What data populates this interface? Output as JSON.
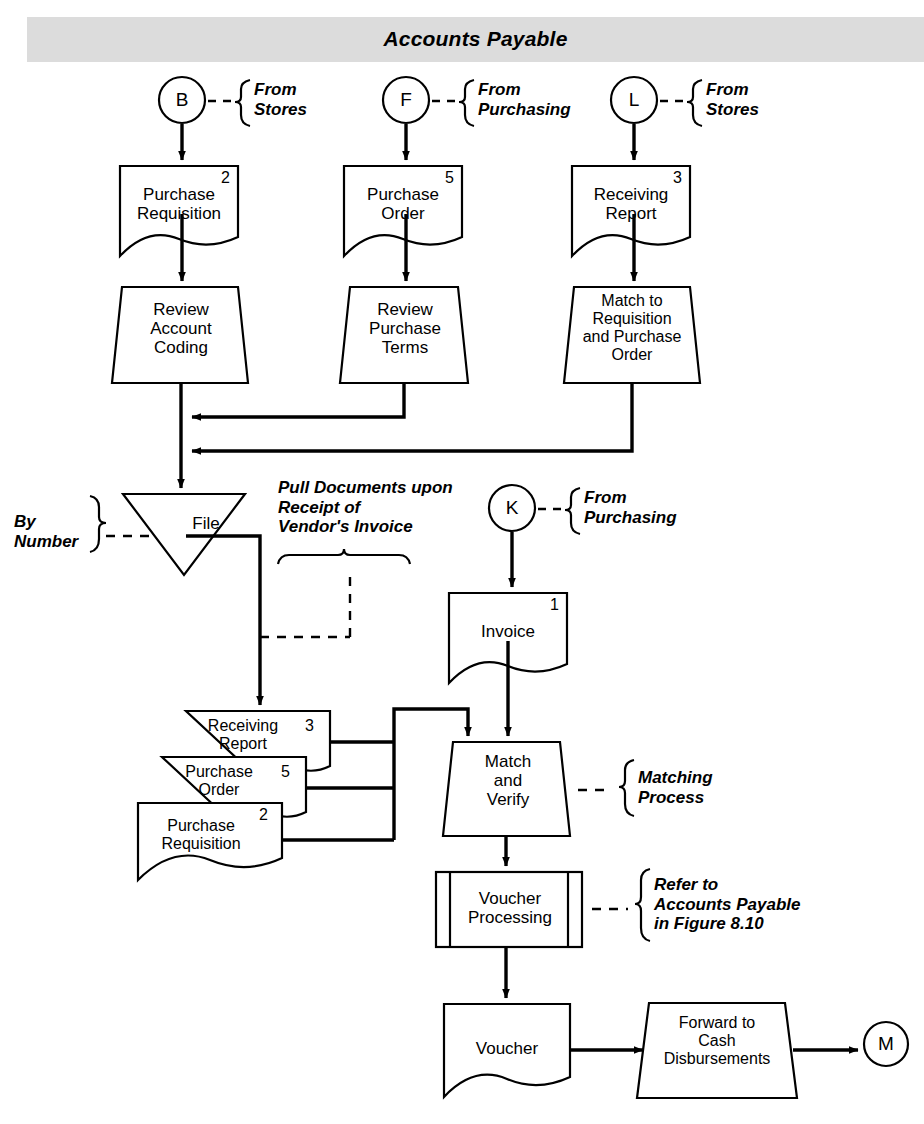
{
  "figure": {
    "band_title": "Accounts Payable",
    "band_color": "#dcdcdc",
    "line_color": "#000000",
    "background": "#ffffff"
  },
  "connectors": {
    "b": {
      "letter": "B",
      "note": "From\nStores"
    },
    "f": {
      "letter": "F",
      "note": "From\nPurchasing"
    },
    "l": {
      "letter": "L",
      "note": "From\nStores"
    },
    "k": {
      "letter": "K",
      "note": "From\nPurchasing"
    },
    "m": {
      "letter": "M"
    }
  },
  "documents": {
    "purchase_requisition_top": {
      "label": "Purchase\nRequisition",
      "copy": "2"
    },
    "purchase_order_top": {
      "label": "Purchase\nOrder",
      "copy": "5"
    },
    "receiving_report_top": {
      "label": "Receiving\nReport",
      "copy": "3"
    },
    "invoice": {
      "label": "Invoice",
      "copy": "1"
    },
    "receiving_report_stack": {
      "label": "Receiving\nReport",
      "copy": "3"
    },
    "purchase_order_stack": {
      "label": "Purchase\nOrder",
      "copy": "5"
    },
    "purchase_requisition_stack": {
      "label": "Purchase\nRequisition",
      "copy": "2"
    },
    "voucher": {
      "label": "Voucher",
      "copy": ""
    }
  },
  "processes": {
    "review_account_coding": {
      "label": "Review\nAccount\nCoding"
    },
    "review_purchase_terms": {
      "label": "Review\nPurchase\nTerms"
    },
    "match_to_requisition": {
      "label": "Match to\nRequisition\nand Purchase\nOrder"
    },
    "match_and_verify": {
      "label": "Match\nand\nVerify"
    },
    "voucher_processing": {
      "label": "Voucher\nProcessing"
    },
    "forward_to_cash": {
      "label": "Forward to\nCash\nDisbursements"
    }
  },
  "file_store": {
    "label": "File",
    "sort_note": "By\nNumber"
  },
  "annotations": {
    "pull_documents": "Pull Documents upon\nReceipt of\nVendor's Invoice",
    "matching_process": "Matching\nProcess",
    "refer_to_ap": "Refer to\nAccounts Payable\nin Figure 8.10"
  }
}
